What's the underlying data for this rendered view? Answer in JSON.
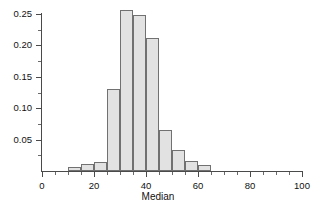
{
  "chart_data": {
    "type": "bar",
    "title": "",
    "subtitle": "",
    "xlabel": "Median",
    "ylabel": "",
    "xlim": [
      0,
      100
    ],
    "ylim": [
      0,
      0.26
    ],
    "grid": false,
    "legend": null,
    "bin_width": 5,
    "bin_edges": [
      10,
      15,
      20,
      25,
      30,
      35,
      40,
      45,
      50,
      55,
      60,
      65
    ],
    "categories": [
      "10-15",
      "15-20",
      "20-25",
      "25-30",
      "30-35",
      "35-40",
      "40-45",
      "45-50",
      "50-55",
      "55-60",
      "60-65"
    ],
    "bin_centers": [
      12.5,
      17.5,
      22.5,
      27.5,
      32.5,
      37.5,
      42.5,
      47.5,
      52.5,
      57.5,
      62.5
    ],
    "values": [
      0.006,
      0.011,
      0.014,
      0.131,
      0.256,
      0.248,
      0.212,
      0.065,
      0.033,
      0.016,
      0.01
    ],
    "bar_fill_color": "#e2e2e2",
    "bar_edge_color": "#717171",
    "axis_color": "#4a4a4a",
    "xticks": [
      {
        "value": 0,
        "label": "0",
        "major": true
      },
      {
        "value": 5,
        "label": "",
        "major": false
      },
      {
        "value": 10,
        "label": "",
        "major": false
      },
      {
        "value": 15,
        "label": "",
        "major": false
      },
      {
        "value": 20,
        "label": "20",
        "major": true
      },
      {
        "value": 25,
        "label": "",
        "major": false
      },
      {
        "value": 30,
        "label": "",
        "major": false
      },
      {
        "value": 35,
        "label": "",
        "major": false
      },
      {
        "value": 40,
        "label": "40",
        "major": true
      },
      {
        "value": 45,
        "label": "",
        "major": false
      },
      {
        "value": 50,
        "label": "",
        "major": false
      },
      {
        "value": 55,
        "label": "",
        "major": false
      },
      {
        "value": 60,
        "label": "60",
        "major": true
      },
      {
        "value": 65,
        "label": "",
        "major": false
      },
      {
        "value": 70,
        "label": "",
        "major": false
      },
      {
        "value": 75,
        "label": "",
        "major": false
      },
      {
        "value": 80,
        "label": "80",
        "major": true
      },
      {
        "value": 85,
        "label": "",
        "major": false
      },
      {
        "value": 90,
        "label": "",
        "major": false
      },
      {
        "value": 95,
        "label": "",
        "major": false
      },
      {
        "value": 100,
        "label": "100",
        "major": true
      }
    ],
    "yticks": [
      {
        "value": 0.025,
        "label": "",
        "major": false
      },
      {
        "value": 0.05,
        "label": "0.05",
        "major": true
      },
      {
        "value": 0.075,
        "label": "",
        "major": false
      },
      {
        "value": 0.1,
        "label": "0.10",
        "major": true
      },
      {
        "value": 0.125,
        "label": "",
        "major": false
      },
      {
        "value": 0.15,
        "label": "0.15",
        "major": true
      },
      {
        "value": 0.175,
        "label": "",
        "major": false
      },
      {
        "value": 0.2,
        "label": "0.20",
        "major": true
      },
      {
        "value": 0.225,
        "label": "",
        "major": false
      },
      {
        "value": 0.25,
        "label": "0.25",
        "major": true
      }
    ]
  },
  "axis": {
    "x_title": "Median"
  }
}
